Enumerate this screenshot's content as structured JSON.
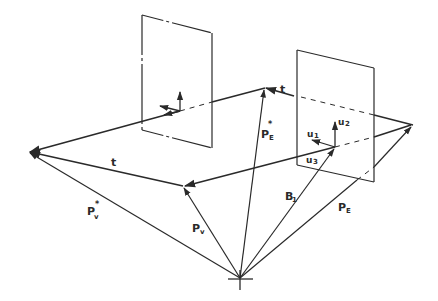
{
  "diagram": {
    "type": "vector-geometry-sketch",
    "stroke_color": "#2a2a2a",
    "background": "#ffffff",
    "labels": {
      "t_top": "t",
      "t_left": "t",
      "pv_star_main": "P",
      "pv_star_sup": "*",
      "pv_star_sub": "v",
      "pv_main": "P",
      "pv_sub": "v",
      "pe_star_main": "P",
      "pe_star_sup": "*",
      "pe_star_sub": "E",
      "pe_main": "P",
      "pe_sub": "E",
      "b_main": "B",
      "b_sub": "1",
      "u1_main": "u",
      "u1_sub": "1",
      "u2_main": "u",
      "u2_sub": "2",
      "u3_main": "u",
      "u3_sub": "3"
    },
    "points": {
      "origin": [
        240,
        278
      ],
      "v_star": [
        28,
        152
      ],
      "v": [
        183,
        186
      ],
      "e_star": [
        265,
        88
      ],
      "frame_origin": [
        335,
        147
      ],
      "right_tip": [
        413,
        125
      ]
    },
    "planes": [
      {
        "name": "left-image-plane",
        "corners": [
          [
            142,
            15
          ],
          [
            212,
            33
          ],
          [
            212,
            148
          ],
          [
            142,
            130
          ]
        ]
      },
      {
        "name": "right-image-plane",
        "corners": [
          [
            297,
            50
          ],
          [
            374,
            68
          ],
          [
            374,
            182
          ],
          [
            297,
            165
          ]
        ]
      }
    ]
  }
}
